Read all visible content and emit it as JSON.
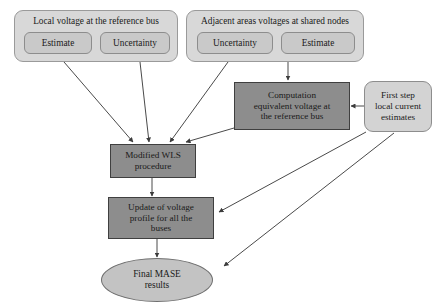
{
  "diagram": {
    "background_color": "#ffffff",
    "colors": {
      "group_fill": "#d8d8d8",
      "pill_fill": "#c9c9c9",
      "process_fill": "#8d8d8d",
      "rounded_light_fill": "#d3d3d3",
      "ellipse_fill": "#c3c3c3",
      "stroke": "#4a4a4a",
      "text": "#1a1a1a"
    },
    "groups": [
      {
        "id": "local-voltage-group",
        "title": "Local voltage at the reference bus",
        "children": [
          {
            "id": "local-estimate",
            "label": "Estimate"
          },
          {
            "id": "local-uncertainty",
            "label": "Uncertainty"
          }
        ]
      },
      {
        "id": "adjacent-areas-group",
        "title": "Adjacent areas voltages at shared nodes",
        "children": [
          {
            "id": "adjacent-uncertainty",
            "label": "Uncertainty"
          },
          {
            "id": "adjacent-estimate",
            "label": "Estimate"
          }
        ]
      }
    ],
    "nodes": [
      {
        "id": "computation-equivalent-voltage",
        "shape": "rectangle",
        "label": "Computation equivalent voltage at the reference bus",
        "lines": [
          "Computation",
          "equivalent voltage at",
          "the reference bus"
        ]
      },
      {
        "id": "first-step-local-current-estimates",
        "shape": "rounded-rectangle",
        "label": "First step local current estimates",
        "lines": [
          "First step",
          "local current",
          "estimates"
        ]
      },
      {
        "id": "modified-wls-procedure",
        "shape": "rectangle",
        "label": "Modified WLS procedure",
        "lines": [
          "Modified WLS",
          "procedure"
        ]
      },
      {
        "id": "update-voltage-profile",
        "shape": "rectangle",
        "label": "Update of voltage profile for all the buses",
        "lines": [
          "Update of voltage",
          "profile for all the",
          "buses"
        ]
      },
      {
        "id": "final-mase-results",
        "shape": "ellipse",
        "label": "Final MASE results",
        "lines": [
          "Final MASE",
          "results"
        ]
      }
    ],
    "edges": [
      {
        "from": "local-estimate",
        "to": "modified-wls-procedure"
      },
      {
        "from": "local-uncertainty",
        "to": "modified-wls-procedure"
      },
      {
        "from": "adjacent-uncertainty",
        "to": "modified-wls-procedure"
      },
      {
        "from": "adjacent-estimate",
        "to": "computation-equivalent-voltage"
      },
      {
        "from": "computation-equivalent-voltage",
        "to": "modified-wls-procedure"
      },
      {
        "from": "first-step-local-current-estimates",
        "to": "computation-equivalent-voltage"
      },
      {
        "from": "first-step-local-current-estimates",
        "to": "update-voltage-profile"
      },
      {
        "from": "first-step-local-current-estimates",
        "to": "final-mase-results"
      },
      {
        "from": "modified-wls-procedure",
        "to": "update-voltage-profile"
      },
      {
        "from": "update-voltage-profile",
        "to": "final-mase-results"
      }
    ]
  }
}
